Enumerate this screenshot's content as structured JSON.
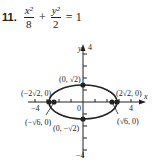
{
  "problem": {
    "number": "11.",
    "equation": {
      "term1": {
        "numerator": "x²",
        "denominator": "8"
      },
      "plus": "+",
      "term2": {
        "numerator": "y²",
        "denominator": "2"
      },
      "equals": "=",
      "rhs": "1"
    }
  },
  "graph": {
    "axis_labels": {
      "x": "x",
      "y": "y"
    },
    "tick_labels": {
      "x_neg": "−4",
      "x_pos": "4",
      "origin": "0",
      "y_pos": "4",
      "y_neg": "−4"
    },
    "points": {
      "vertex_left": "(−2√2, 0)",
      "vertex_right": "(2√2, 0)",
      "covertex_top": "(0, √2)",
      "covertex_bottom": "(0, −√2)",
      "focus_left": "(−√6, 0)",
      "focus_right": "(√6, 0)"
    },
    "colors": {
      "ink": "#222222",
      "background": "#ffffff"
    }
  }
}
